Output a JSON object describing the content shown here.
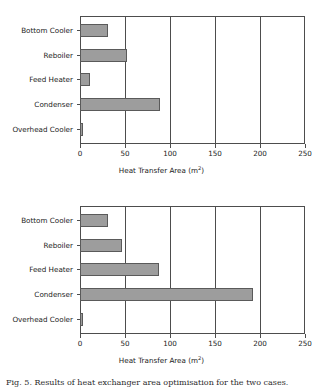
{
  "figure": {
    "caption": "Fig. 5. Results of heat exchanger area optimisation for the two cases."
  },
  "axis_title": "Heat Transfer Area (m",
  "axis_title_sup": "2",
  "axis_title_close": ")",
  "colors": {
    "bar_fill": "#9d9d9d",
    "bar_border": "#5a5a5a",
    "axis": "#4d4d4d",
    "background": "#ffffff"
  },
  "chart_data": [
    {
      "type": "bar",
      "orientation": "horizontal",
      "panel": "top",
      "title": "",
      "xlabel": "Heat Transfer Area (m2)",
      "ylabel": "",
      "categories": [
        "Bottom Cooler",
        "Reboiler",
        "Feed Heater",
        "Condenser",
        "Overhead Cooler"
      ],
      "values": [
        31,
        52,
        11,
        89,
        3
      ],
      "xlim": [
        0,
        250
      ],
      "xticks": [
        0,
        50,
        100,
        150,
        200,
        250
      ],
      "grid": true,
      "grid_axis": "x",
      "legend": false
    },
    {
      "type": "bar",
      "orientation": "horizontal",
      "panel": "bottom",
      "title": "",
      "xlabel": "Heat Transfer Area (m2)",
      "ylabel": "",
      "categories": [
        "Bottom Cooler",
        "Reboiler",
        "Feed Heater",
        "Condenser",
        "Overhead Cooler"
      ],
      "values": [
        31,
        47,
        88,
        192,
        3
      ],
      "xlim": [
        0,
        250
      ],
      "xticks": [
        0,
        50,
        100,
        150,
        200,
        250
      ],
      "grid": true,
      "grid_axis": "x",
      "legend": false
    }
  ]
}
